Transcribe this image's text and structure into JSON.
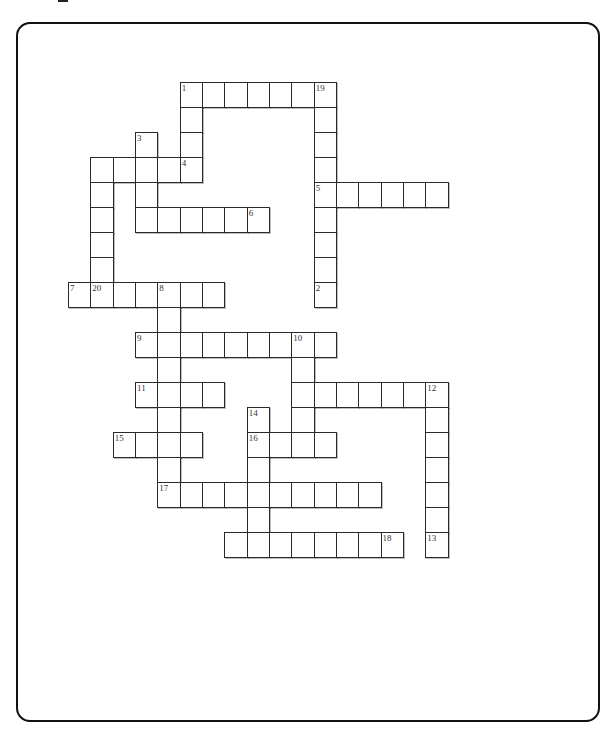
{
  "puzzle": {
    "grid": {
      "origin_x": 68,
      "origin_y": 82,
      "cell_w": 22.33,
      "cell_h": 25
    },
    "cells": [
      [
        0,
        5,
        "1"
      ],
      [
        0,
        6,
        ""
      ],
      [
        0,
        7,
        ""
      ],
      [
        0,
        8,
        ""
      ],
      [
        0,
        9,
        ""
      ],
      [
        0,
        10,
        ""
      ],
      [
        0,
        11,
        "19"
      ],
      [
        1,
        5,
        ""
      ],
      [
        1,
        11,
        ""
      ],
      [
        2,
        3,
        "3"
      ],
      [
        2,
        5,
        ""
      ],
      [
        2,
        11,
        ""
      ],
      [
        3,
        1,
        ""
      ],
      [
        3,
        2,
        ""
      ],
      [
        3,
        3,
        ""
      ],
      [
        3,
        4,
        ""
      ],
      [
        3,
        5,
        "4"
      ],
      [
        3,
        11,
        ""
      ],
      [
        4,
        1,
        ""
      ],
      [
        4,
        3,
        ""
      ],
      [
        4,
        11,
        "5"
      ],
      [
        4,
        12,
        ""
      ],
      [
        4,
        13,
        ""
      ],
      [
        4,
        14,
        ""
      ],
      [
        4,
        15,
        ""
      ],
      [
        4,
        16,
        ""
      ],
      [
        5,
        1,
        ""
      ],
      [
        5,
        3,
        ""
      ],
      [
        5,
        4,
        ""
      ],
      [
        5,
        5,
        ""
      ],
      [
        5,
        6,
        ""
      ],
      [
        5,
        7,
        ""
      ],
      [
        5,
        8,
        "6"
      ],
      [
        5,
        11,
        ""
      ],
      [
        6,
        1,
        ""
      ],
      [
        6,
        11,
        ""
      ],
      [
        7,
        1,
        ""
      ],
      [
        7,
        11,
        ""
      ],
      [
        8,
        0,
        "7"
      ],
      [
        8,
        1,
        "20"
      ],
      [
        8,
        2,
        ""
      ],
      [
        8,
        3,
        ""
      ],
      [
        8,
        4,
        "8"
      ],
      [
        8,
        5,
        ""
      ],
      [
        8,
        6,
        ""
      ],
      [
        8,
        11,
        "2"
      ],
      [
        9,
        4,
        ""
      ],
      [
        10,
        3,
        "9"
      ],
      [
        10,
        4,
        ""
      ],
      [
        10,
        5,
        ""
      ],
      [
        10,
        6,
        ""
      ],
      [
        10,
        7,
        ""
      ],
      [
        10,
        8,
        ""
      ],
      [
        10,
        9,
        ""
      ],
      [
        10,
        10,
        "10"
      ],
      [
        10,
        11,
        ""
      ],
      [
        11,
        4,
        ""
      ],
      [
        11,
        10,
        ""
      ],
      [
        12,
        3,
        "11"
      ],
      [
        12,
        4,
        ""
      ],
      [
        12,
        5,
        ""
      ],
      [
        12,
        6,
        ""
      ],
      [
        12,
        10,
        ""
      ],
      [
        12,
        11,
        ""
      ],
      [
        12,
        12,
        ""
      ],
      [
        12,
        13,
        ""
      ],
      [
        12,
        14,
        ""
      ],
      [
        12,
        15,
        ""
      ],
      [
        12,
        16,
        "12"
      ],
      [
        13,
        4,
        ""
      ],
      [
        13,
        8,
        "14"
      ],
      [
        13,
        10,
        ""
      ],
      [
        13,
        16,
        ""
      ],
      [
        14,
        2,
        "15"
      ],
      [
        14,
        3,
        ""
      ],
      [
        14,
        4,
        ""
      ],
      [
        14,
        5,
        ""
      ],
      [
        14,
        8,
        "16"
      ],
      [
        14,
        9,
        ""
      ],
      [
        14,
        10,
        ""
      ],
      [
        14,
        11,
        ""
      ],
      [
        14,
        16,
        ""
      ],
      [
        15,
        4,
        ""
      ],
      [
        15,
        8,
        ""
      ],
      [
        15,
        16,
        ""
      ],
      [
        16,
        4,
        "17"
      ],
      [
        16,
        5,
        ""
      ],
      [
        16,
        6,
        ""
      ],
      [
        16,
        7,
        ""
      ],
      [
        16,
        8,
        ""
      ],
      [
        16,
        9,
        ""
      ],
      [
        16,
        10,
        ""
      ],
      [
        16,
        11,
        ""
      ],
      [
        16,
        12,
        ""
      ],
      [
        16,
        13,
        ""
      ],
      [
        16,
        16,
        ""
      ],
      [
        17,
        8,
        ""
      ],
      [
        17,
        16,
        ""
      ],
      [
        18,
        7,
        ""
      ],
      [
        18,
        8,
        ""
      ],
      [
        18,
        9,
        ""
      ],
      [
        18,
        10,
        ""
      ],
      [
        18,
        11,
        ""
      ],
      [
        18,
        12,
        ""
      ],
      [
        18,
        13,
        ""
      ],
      [
        18,
        14,
        "18"
      ],
      [
        18,
        16,
        "13"
      ]
    ],
    "clue_numbers": [
      "1",
      "2",
      "3",
      "4",
      "5",
      "6",
      "7",
      "8",
      "9",
      "10",
      "11",
      "12",
      "13",
      "14",
      "15",
      "16",
      "17",
      "18",
      "19",
      "20"
    ]
  }
}
